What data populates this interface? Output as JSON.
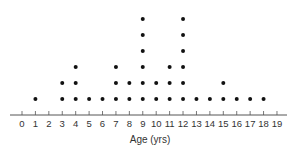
{
  "chart_data": {
    "type": "dot",
    "title": "",
    "xlabel": "Age (yrs)",
    "ylabel": "",
    "xlim": [
      0,
      19
    ],
    "grid": false,
    "legend": null,
    "x": [
      0,
      1,
      2,
      3,
      4,
      5,
      6,
      7,
      8,
      9,
      10,
      11,
      12,
      13,
      14,
      15,
      16,
      17,
      18,
      19
    ],
    "tick_labels": [
      "0",
      "1",
      "2",
      "3",
      "4",
      "5",
      "6",
      "7",
      "8",
      "9",
      "10",
      "11",
      "12",
      "13",
      "14",
      "15",
      "16",
      "17",
      "18",
      "19"
    ],
    "counts": [
      0,
      1,
      0,
      2,
      3,
      1,
      1,
      3,
      2,
      6,
      2,
      3,
      6,
      1,
      1,
      2,
      1,
      1,
      1,
      0
    ],
    "total": 37
  },
  "colors": {
    "axis": "#555555",
    "dot": "#111111",
    "text": "#333333"
  }
}
